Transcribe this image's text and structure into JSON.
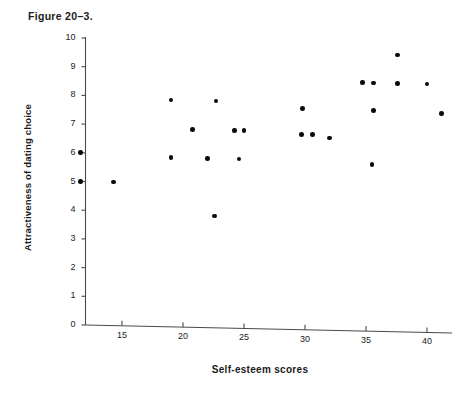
{
  "figure": {
    "title": "Figure 20–3."
  },
  "axes": {
    "y_label": "Attractiveness of dating choice",
    "x_label": "Self-esteem scores",
    "y_ticks": [
      "0",
      "1",
      "2",
      "3",
      "4",
      "5",
      "6",
      "7",
      "8",
      "9",
      "10"
    ],
    "x_ticks": [
      "15",
      "20",
      "25",
      "30",
      "35",
      "40"
    ]
  },
  "chart_data": {
    "type": "scatter",
    "title": "Figure 20–3.",
    "xlabel": "Self-esteem scores",
    "ylabel": "Attractiveness of dating choice",
    "xlim": [
      11,
      42
    ],
    "ylim": [
      0,
      10
    ],
    "xticks": [
      15,
      20,
      25,
      30,
      35,
      40
    ],
    "yticks": [
      0,
      1,
      2,
      3,
      4,
      5,
      6,
      7,
      8,
      9,
      10
    ],
    "grid": false,
    "legend": false,
    "marker": "filled-circle",
    "marker_color": "#0a0a0a",
    "points": [
      {
        "x": 11.6,
        "y": 6.0
      },
      {
        "x": 11.6,
        "y": 5.0
      },
      {
        "x": 14.3,
        "y": 5.0
      },
      {
        "x": 19.0,
        "y": 7.9
      },
      {
        "x": 19.0,
        "y": 5.9
      },
      {
        "x": 20.8,
        "y": 6.9
      },
      {
        "x": 22.0,
        "y": 5.9
      },
      {
        "x": 22.7,
        "y": 7.9
      },
      {
        "x": 22.6,
        "y": 3.9
      },
      {
        "x": 24.2,
        "y": 6.9
      },
      {
        "x": 25.0,
        "y": 6.9
      },
      {
        "x": 24.6,
        "y": 5.9
      },
      {
        "x": 29.8,
        "y": 7.7
      },
      {
        "x": 29.7,
        "y": 6.8
      },
      {
        "x": 30.6,
        "y": 6.8
      },
      {
        "x": 32.0,
        "y": 6.7
      },
      {
        "x": 34.7,
        "y": 8.65
      },
      {
        "x": 35.6,
        "y": 8.65
      },
      {
        "x": 35.6,
        "y": 7.7
      },
      {
        "x": 35.5,
        "y": 5.8
      },
      {
        "x": 37.6,
        "y": 9.65
      },
      {
        "x": 37.6,
        "y": 8.65
      },
      {
        "x": 40.0,
        "y": 8.65
      },
      {
        "x": 41.2,
        "y": 7.65
      }
    ]
  }
}
